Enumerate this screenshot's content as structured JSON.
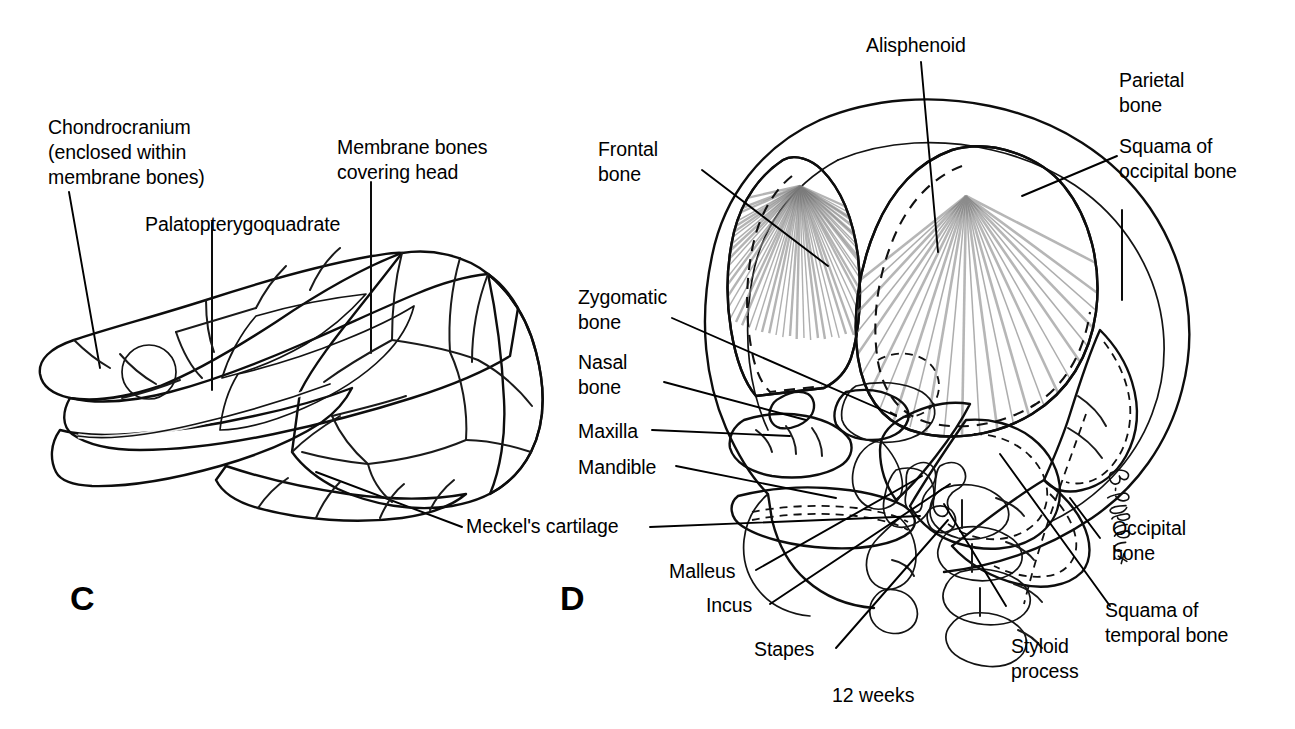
{
  "figure": {
    "caption": "12 weeks",
    "signature": "B. Willis",
    "panels": [
      {
        "letter": "C",
        "subject": "chondrocranium-and-membrane-bones-skull",
        "labels": [
          "Chondrocranium\n(enclosed within\nmembrane bones)",
          "Palatopterygoquadrate",
          "Membrane bones\ncovering head",
          "Meckel's cartilage"
        ]
      },
      {
        "letter": "D",
        "subject": "twelve-week-fetal-skull-lateral-view",
        "labels": [
          "Alisphenoid",
          "Parietal\nbone",
          "Squama of\noccipital bone",
          "Frontal\nbone",
          "Zygomatic\nbone",
          "Nasal\nbone",
          "Maxilla",
          "Mandible",
          "Malleus",
          "Incus",
          "Stapes",
          "Styloid\nprocess",
          "Occipital\nbone",
          "Squama of\ntemporal bone"
        ]
      }
    ]
  },
  "panel_c": {
    "letter": "C",
    "label_chondrocranium": "Chondrocranium\n(enclosed within\nmembrane bones)",
    "label_palatopterygoquadrate": "Palatopterygoquadrate",
    "label_membrane_bones": "Membrane bones\ncovering head",
    "label_meckels_cartilage": "Meckel's cartilage"
  },
  "panel_d": {
    "letter": "D",
    "label_alisphenoid": "Alisphenoid",
    "label_parietal_bone": "Parietal\nbone",
    "label_squama_occipital": "Squama of\noccipital bone",
    "label_frontal_bone": "Frontal\nbone",
    "label_zygomatic_bone": "Zygomatic\nbone",
    "label_nasal_bone": "Nasal\nbone",
    "label_maxilla": "Maxilla",
    "label_mandible": "Mandible",
    "label_malleus": "Malleus",
    "label_incus": "Incus",
    "label_stapes": "Stapes",
    "label_styloid_process": "Styloid\nprocess",
    "label_occipital_bone": "Occipital\nbone",
    "label_squama_temporal": "Squama of\ntemporal bone"
  },
  "caption": {
    "age": "12 weeks"
  },
  "colors": {
    "ink": "#000000",
    "bone_light": "#cfcfcf",
    "bone_mid": "#b0b0b0",
    "bone_dark": "#8a8a8a",
    "shadow": "#6b6b6b",
    "background": "#ffffff"
  }
}
